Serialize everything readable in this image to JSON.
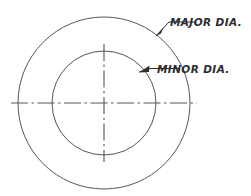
{
  "drawing": {
    "title": "Screw thread diameter callout diagram",
    "background_color": "#ffffff",
    "line_color": "#55565a",
    "text_color": "#2b2c2f",
    "center": {
      "x": 104,
      "y": 103
    },
    "circles": [
      {
        "name": "major-diameter-circle",
        "label": "MAJOR DIA.",
        "radius": 86,
        "cx": 104,
        "cy": 103
      },
      {
        "name": "minor-diameter-circle",
        "label": "MINOR DIA.",
        "radius": 52,
        "cx": 104,
        "cy": 103
      }
    ],
    "callouts": [
      {
        "id": "major",
        "text": "MAJOR DIA.",
        "text_x": 170,
        "text_y": 26,
        "leader_path": "M 156 36 L 169 22 L 196 22",
        "arrow_points": "156,36 163,27 161,33"
      },
      {
        "id": "minor",
        "text": "MINOR DIA.",
        "text_x": 157,
        "text_y": 74,
        "leader_path": "M 139 72 L 150 69 L 180 69",
        "arrow_points": "139,72 149,65 149,72"
      }
    ],
    "center_lines": [
      {
        "name": "horizontal-center-line",
        "x1": 11,
        "y1": 103,
        "x2": 197,
        "y2": 103
      },
      {
        "name": "vertical-center-line",
        "x1": 104,
        "y1": 44,
        "x2": 104,
        "y2": 162
      }
    ]
  }
}
